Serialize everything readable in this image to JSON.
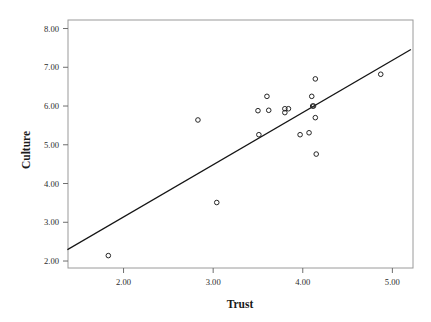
{
  "chart_data": {
    "type": "scatter",
    "title": "",
    "xlabel": "Trust",
    "ylabel": "Culture",
    "xlim": [
      1.38,
      5.23
    ],
    "ylim": [
      1.82,
      8.22
    ],
    "grid": false,
    "legend": "none",
    "xticks": [
      2.0,
      3.0,
      4.0,
      5.0
    ],
    "xtick_labels": [
      "2.00",
      "3.00",
      "4.00",
      "5.00"
    ],
    "yticks": [
      2.0,
      3.0,
      4.0,
      5.0,
      6.0,
      7.0,
      8.0
    ],
    "ytick_labels": [
      "2.00",
      "3.00",
      "4.00",
      "5.00",
      "6.00",
      "7.00",
      "8.00"
    ],
    "marker": "open-circle",
    "points": [
      {
        "x": 1.83,
        "y": 2.14
      },
      {
        "x": 2.83,
        "y": 5.64
      },
      {
        "x": 3.04,
        "y": 3.51
      },
      {
        "x": 3.5,
        "y": 5.88
      },
      {
        "x": 3.51,
        "y": 5.26
      },
      {
        "x": 3.6,
        "y": 6.25
      },
      {
        "x": 3.62,
        "y": 5.89
      },
      {
        "x": 3.8,
        "y": 5.93
      },
      {
        "x": 3.8,
        "y": 5.83
      },
      {
        "x": 3.84,
        "y": 5.93
      },
      {
        "x": 3.97,
        "y": 5.26
      },
      {
        "x": 4.07,
        "y": 5.31
      },
      {
        "x": 4.1,
        "y": 6.25
      },
      {
        "x": 4.11,
        "y": 6.0
      },
      {
        "x": 4.12,
        "y": 6.0
      },
      {
        "x": 4.14,
        "y": 6.7
      },
      {
        "x": 4.14,
        "y": 5.7
      },
      {
        "x": 4.15,
        "y": 4.76
      },
      {
        "x": 4.87,
        "y": 6.82
      }
    ],
    "fit_line": {
      "type": "linear-regression",
      "x_start": 1.38,
      "y_start": 2.3,
      "x_end": 5.2,
      "y_end": 7.45
    },
    "colors": {
      "marker_stroke": "#262626",
      "fit_line": "#151515",
      "frame": "#9a9a9a",
      "text": "#1a1a1a",
      "background": "#ffffff"
    }
  }
}
